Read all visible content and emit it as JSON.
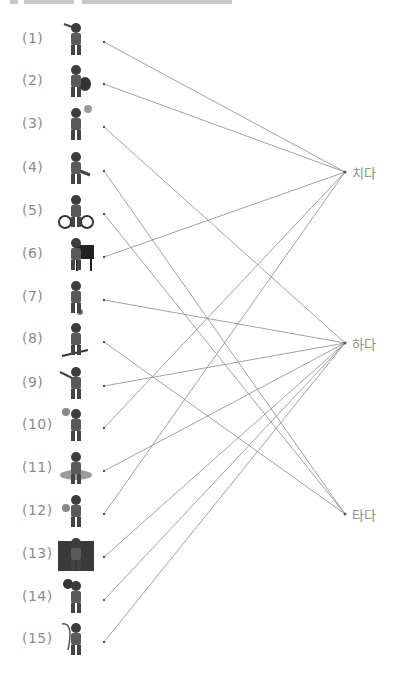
{
  "diagram": {
    "type": "matching-lines",
    "line_color": "#8a8a8a",
    "label_color": "#8c8c8c",
    "left_items": [
      {
        "label": "(1)",
        "icon": "golf-player-icon",
        "y": 42
      },
      {
        "label": "(2)",
        "icon": "violin-player-icon",
        "y": 84
      },
      {
        "label": "(3)",
        "icon": "volleyball-player-icon",
        "y": 127
      },
      {
        "label": "(4)",
        "icon": "ice-skater-icon",
        "y": 171
      },
      {
        "label": "(5)",
        "icon": "bicycle-rider-icon",
        "y": 214
      },
      {
        "label": "(6)",
        "icon": "piano-player-icon",
        "y": 257
      },
      {
        "label": "(7)",
        "icon": "soccer-player-icon",
        "y": 300
      },
      {
        "label": "(8)",
        "icon": "skier-icon",
        "y": 342
      },
      {
        "label": "(9)",
        "icon": "baseball-batter-icon",
        "y": 386
      },
      {
        "label": "(10)",
        "icon": "badminton-player-icon",
        "y": 428
      },
      {
        "label": "(11)",
        "icon": "swimmer-icon",
        "y": 471
      },
      {
        "label": "(12)",
        "icon": "tennis-player-icon",
        "y": 514
      },
      {
        "label": "(13)",
        "icon": "hiker-icon",
        "y": 557
      },
      {
        "label": "(14)",
        "icon": "basketball-player-icon",
        "y": 600
      },
      {
        "label": "(15)",
        "icon": "fishing-icon",
        "y": 642
      }
    ],
    "right_items": [
      {
        "label": "치다",
        "key": "chida",
        "y": 172
      },
      {
        "label": "하다",
        "key": "hada",
        "y": 343
      },
      {
        "label": "타다",
        "key": "tada",
        "y": 514
      }
    ],
    "connections": [
      {
        "from": 1,
        "to": "chida"
      },
      {
        "from": 2,
        "to": "chida"
      },
      {
        "from": 3,
        "to": "hada"
      },
      {
        "from": 4,
        "to": "tada"
      },
      {
        "from": 5,
        "to": "tada"
      },
      {
        "from": 6,
        "to": "chida"
      },
      {
        "from": 7,
        "to": "hada"
      },
      {
        "from": 8,
        "to": "tada"
      },
      {
        "from": 9,
        "to": "hada"
      },
      {
        "from": 10,
        "to": "chida"
      },
      {
        "from": 11,
        "to": "hada"
      },
      {
        "from": 12,
        "to": "chida"
      },
      {
        "from": 13,
        "to": "hada"
      },
      {
        "from": 14,
        "to": "hada"
      },
      {
        "from": 15,
        "to": "hada"
      }
    ]
  }
}
